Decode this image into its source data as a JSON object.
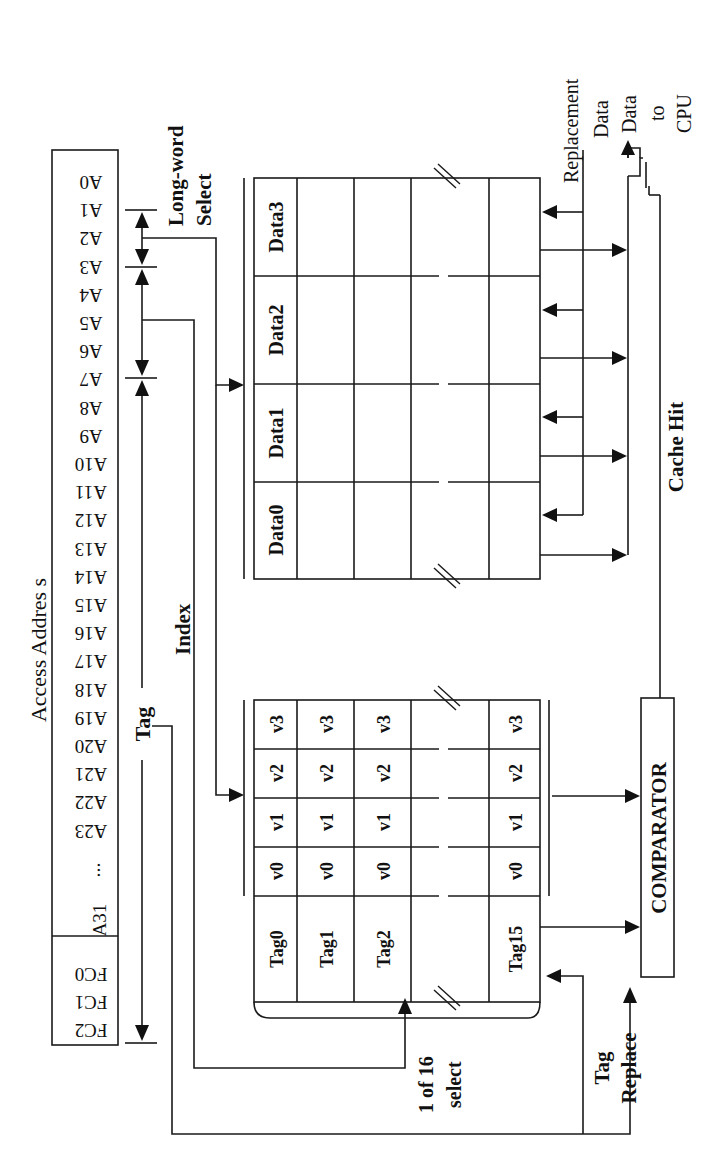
{
  "figure": {
    "orientation": "rotated 90 degrees counter-clockwise",
    "address_register": {
      "label": "Access Addres s",
      "address_bits": [
        "A0",
        "A1",
        "A2",
        "A3",
        "A4",
        "A5",
        "A6",
        "A7",
        "A8",
        "A9",
        "A10",
        "A11",
        "A12",
        "A13",
        "A14",
        "A15",
        "A16",
        "A17",
        "A18",
        "A19",
        "A20",
        "A21",
        "A22",
        "A23"
      ],
      "ellipsis": "...",
      "high_bit": "A31",
      "function_codes": [
        "FC0",
        "FC1",
        "FC2"
      ]
    },
    "fields": {
      "long_word_select": "Long-word Select",
      "long_word_select_line1": "Long-word",
      "long_word_select_line2": "Select",
      "index": "Index",
      "tag": "Tag"
    },
    "tag_array": {
      "rows": [
        {
          "tag": "Tag0",
          "valid": [
            "v0",
            "v1",
            "v2",
            "v3"
          ]
        },
        {
          "tag": "Tag1",
          "valid": [
            "v0",
            "v1",
            "v2",
            "v3"
          ]
        },
        {
          "tag": "Tag2",
          "valid": [
            "v0",
            "v1",
            "v2",
            "v3"
          ]
        },
        {
          "tag": "",
          "valid": [
            "",
            "",
            "",
            ""
          ]
        },
        {
          "tag": "Tag15",
          "valid": [
            "v0",
            "v1",
            "v2",
            "v3"
          ]
        }
      ],
      "select_label_line1": "1 of 16",
      "select_label_line2": "select"
    },
    "data_array": {
      "headers": [
        "Data0",
        "Data1",
        "Data2",
        "Data3"
      ],
      "row_count": 5
    },
    "comparator": {
      "label": "COMPARATOR"
    },
    "signals": {
      "cache_hit": "Cache Hit",
      "tag_replace_line1": "Tag",
      "tag_replace_line2": "Replace",
      "replacement_data_line1": "Replacement",
      "replacement_data_line2": "Data",
      "data_to_cpu_line1": "Data",
      "data_to_cpu_line2": "to",
      "data_to_cpu_line3": "CPU"
    }
  }
}
